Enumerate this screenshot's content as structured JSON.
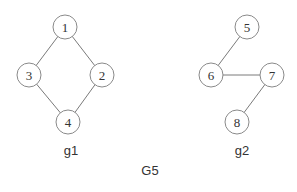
{
  "diagram": {
    "title": "G5",
    "node_radius": 12,
    "graphs": [
      {
        "name": "g1",
        "label_pos": [
          71,
          150
        ],
        "nodes": [
          {
            "id": "1",
            "x": 65,
            "y": 27
          },
          {
            "id": "2",
            "x": 102,
            "y": 75
          },
          {
            "id": "3",
            "x": 29,
            "y": 75
          },
          {
            "id": "4",
            "x": 68,
            "y": 122
          }
        ],
        "edges": [
          [
            "1",
            "3"
          ],
          [
            "1",
            "2"
          ],
          [
            "3",
            "4"
          ],
          [
            "2",
            "4"
          ]
        ]
      },
      {
        "name": "g2",
        "label_pos": [
          242,
          150
        ],
        "nodes": [
          {
            "id": "5",
            "x": 247,
            "y": 27
          },
          {
            "id": "6",
            "x": 211,
            "y": 75
          },
          {
            "id": "7",
            "x": 272,
            "y": 75
          },
          {
            "id": "8",
            "x": 237,
            "y": 122
          }
        ],
        "edges": [
          [
            "5",
            "6"
          ],
          [
            "6",
            "7"
          ],
          [
            "7",
            "8"
          ]
        ]
      }
    ],
    "title_pos": [
      150,
      170
    ]
  },
  "colors": {
    "edge": "#7a7a7a",
    "node_stroke": "#8a8a8a",
    "text": "#333333",
    "background": "#ffffff"
  }
}
